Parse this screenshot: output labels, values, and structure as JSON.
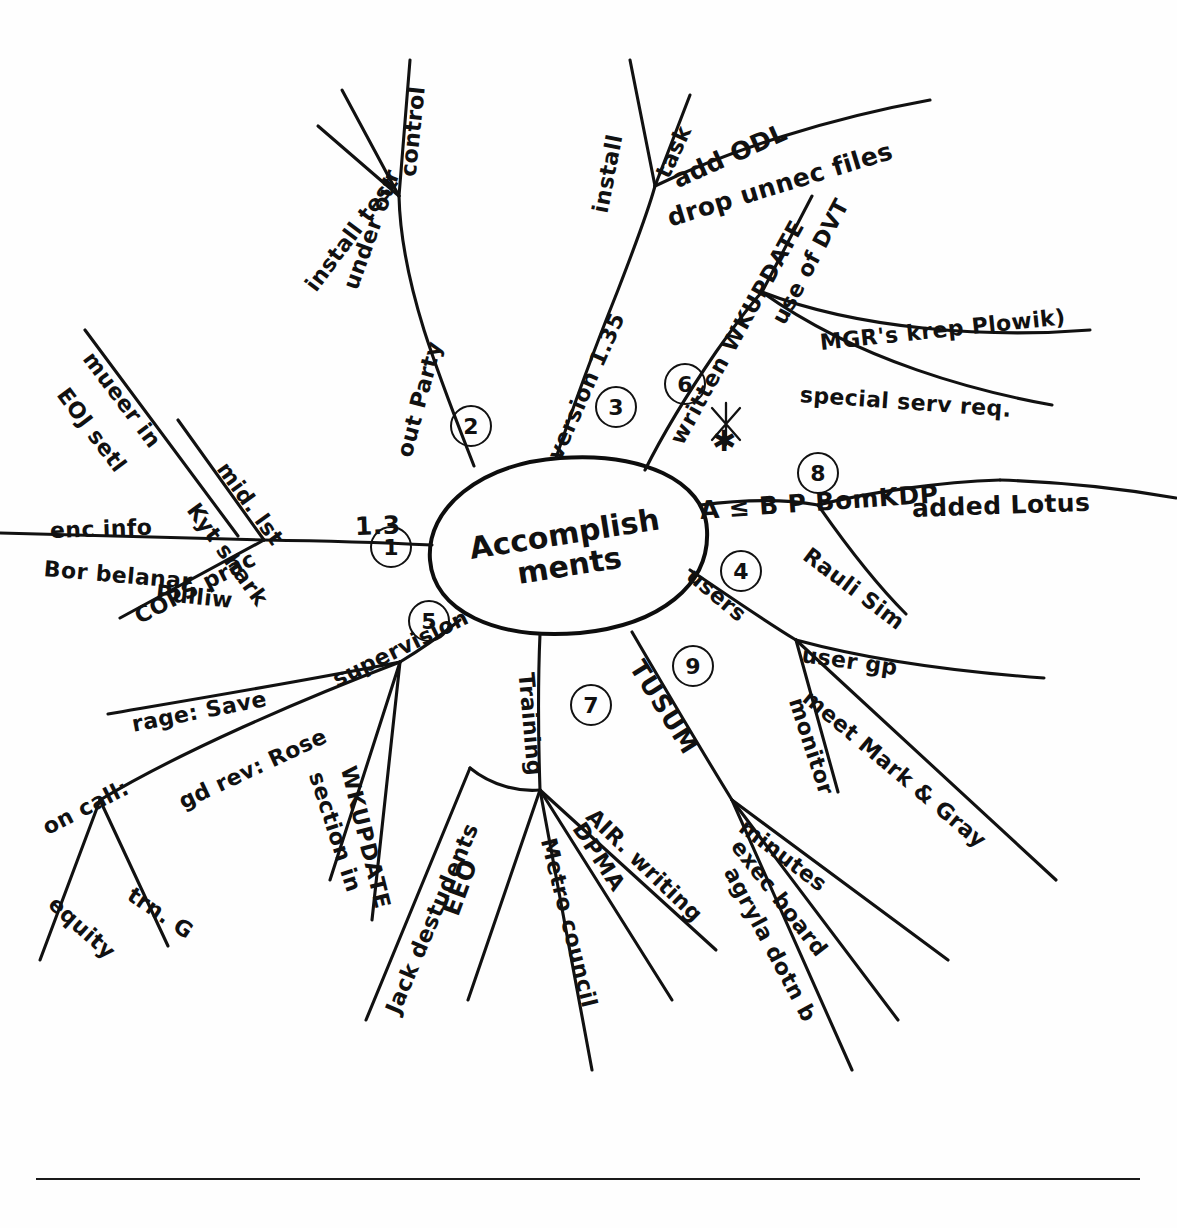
{
  "document": {
    "type": "hand-drawn radial mind map",
    "title": "Accomplishments",
    "center_text_line1": "Accomplish",
    "center_text_line2": "ments",
    "ink_color": "#111111",
    "background_color": "#ffffff",
    "rule_color": "#1a1a1a"
  },
  "branches": [
    {
      "number": "1",
      "label": "1.3",
      "children": [
        {
          "label": "mid. lst"
        },
        {
          "label": "Kyt shark"
        },
        {
          "label": "mueer in"
        },
        {
          "label": "EOJ setl"
        },
        {
          "label": "enc info"
        },
        {
          "label": "Bor belanar"
        },
        {
          "label": "Pulliw"
        },
        {
          "label": "COPS prac"
        }
      ]
    },
    {
      "number": "2",
      "label": "out Party",
      "children": [
        {
          "label": "install test"
        },
        {
          "label": "under our"
        },
        {
          "label": "control"
        }
      ]
    },
    {
      "number": "3",
      "label": "version 1.35",
      "children": [
        {
          "label": "install"
        },
        {
          "label": "task"
        },
        {
          "label": "add ODL"
        },
        {
          "label": "drop unnec files"
        }
      ]
    },
    {
      "number": "4",
      "label": "users",
      "children": [
        {
          "label": "user gp"
        },
        {
          "label": "meet Mark & Gray"
        },
        {
          "label": "monitor"
        }
      ]
    },
    {
      "number": "5",
      "label": "supervision",
      "children": [
        {
          "label": "rage: Save"
        },
        {
          "label": "gd rev: Rose"
        },
        {
          "label": "section in"
        },
        {
          "label": "WKUPDATE"
        },
        {
          "label": "on call:"
        },
        {
          "label": "equity"
        },
        {
          "label": "trn. G"
        }
      ]
    },
    {
      "number": "6",
      "label": "written WKUPDATE",
      "children": [
        {
          "label": "use of DVT"
        },
        {
          "label": "MGR's krep Plowik)"
        },
        {
          "label": "special serv req."
        }
      ]
    },
    {
      "number": "7",
      "label": "Training",
      "children": [
        {
          "label": "Jack destudents"
        },
        {
          "label": "EEO"
        },
        {
          "label": "Metro council"
        },
        {
          "label": "DPMA"
        },
        {
          "label": "AIR. writing"
        }
      ]
    },
    {
      "number": "8",
      "label": "A ≤ B  P BomKDP",
      "children": [
        {
          "label": "added Lotus"
        },
        {
          "label": "Rauli Sim"
        }
      ]
    },
    {
      "number": "9",
      "label": "TUSUM",
      "children": [
        {
          "label": "minutes"
        },
        {
          "label": "exec board"
        },
        {
          "label": "agryla dotn b"
        }
      ]
    }
  ],
  "marks": {
    "asterisk": "✱"
  },
  "labels": {
    "b1_num": "1",
    "b2_num": "2",
    "b3_num": "3",
    "b4_num": "4",
    "b5_num": "5",
    "b6_num": "6",
    "b7_num": "7",
    "b8_num": "8",
    "b9_num": "9",
    "b1_main": "1.3",
    "b2_main": "out Party",
    "b3_main": "version 1.35",
    "b4_main": "users",
    "b5_main": "supervision",
    "b6_main": "written WKUPDATE",
    "b7_main": "Training",
    "b8_main": "A ≤ B  P BomKDP",
    "b9_main": "TUSUM",
    "b1_c1": "mid. lst",
    "b1_c2": "Kyt shark",
    "b1_c3": "mueer in",
    "b1_c4": "EOJ setl",
    "b1_c5": "enc info",
    "b1_c6": "Bor belanar",
    "b1_c7": "Pulliw",
    "b1_c8": "COPS prac",
    "b2_c1": "install test",
    "b2_c2": "under our",
    "b2_c3": "control",
    "b3_c1": "install",
    "b3_c2": "task",
    "b3_c3": "add ODL",
    "b3_c4": "drop unnec files",
    "b4_c1": "user gp",
    "b4_c2": "meet Mark & Gray",
    "b4_c3": "monitor",
    "b5_c1": "rage: Save",
    "b5_c2": "gd rev: Rose",
    "b5_c3": "section in",
    "b5_c4": "WKUPDATE",
    "b5_c5": "on call:",
    "b5_c6": "equity",
    "b5_c7": "trn. G",
    "b6_c1": "use of DVT",
    "b6_c2": "MGR's krep Plowik)",
    "b6_c3": "special serv req.",
    "b7_c1": "Jack destudents",
    "b7_c2": "EEO",
    "b7_c3": "Metro council",
    "b7_c4": "DPMA",
    "b7_c5": "AIR. writing",
    "b8_c1": "added Lotus",
    "b8_c2": "Rauli Sim",
    "b9_c1": "minutes",
    "b9_c2": "exec board",
    "b9_c3": "agryla dotn b",
    "center_l1": "Accomplish",
    "center_l2": "ments",
    "asterisk": "✱"
  }
}
